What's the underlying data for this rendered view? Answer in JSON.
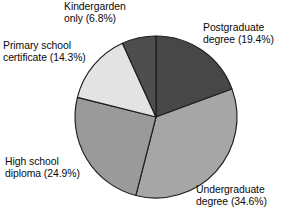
{
  "chart_data": {
    "type": "pie",
    "title": "",
    "subtitle": "",
    "xlabel": "",
    "ylabel": "",
    "legend_position": "none",
    "grid": false,
    "start_angle_deg": 0,
    "direction": "clockwise",
    "categories": [
      "Postgraduate degree",
      "Undergraduate degree",
      "High school diploma",
      "Primary school certificate",
      "Kindergarden only"
    ],
    "values": [
      19.4,
      34.6,
      24.9,
      14.3,
      6.8
    ],
    "units": "percent",
    "total": 100.0,
    "slices": [
      {
        "label": "Postgraduate degree",
        "value": 19.4,
        "value_text": "19.4%",
        "annotation": "Postgraduate\ndegree (19.4%)",
        "color": "#474747"
      },
      {
        "label": "Undergraduate degree",
        "value": 34.6,
        "value_text": "34.6%",
        "annotation": "Undergraduate\ndegree (34.6%)",
        "color": "#a6a6a6"
      },
      {
        "label": "High school diploma",
        "value": 24.9,
        "value_text": "24.9%",
        "annotation": "High school\ndiploma (24.9%)",
        "color": "#9a9a9a"
      },
      {
        "label": "Primary school certificate",
        "value": 14.3,
        "value_text": "14.3%",
        "annotation": "Primary school\ncertificate (14.3%)",
        "color": "#e3e3e3"
      },
      {
        "label": "Kindergarden only",
        "value": 6.8,
        "value_text": "6.8%",
        "annotation": "Kindergarden\nonly (6.8%)",
        "color": "#4e4e4e"
      }
    ]
  },
  "labels": {
    "kindergarden": "Kindergarden\nonly (6.8%)",
    "postgraduate": "Postgraduate\ndegree (19.4%)",
    "primary_school": "Primary school\ncertificate (14.3%)",
    "high_school": "High school\ndiploma (24.9%)",
    "undergraduate": "Undergraduate\ndegree (34.6%)"
  },
  "colors": {
    "background": "#ffffff",
    "outline": "#1d1d1d",
    "text": "#0a0a0a"
  },
  "geometry": {
    "center_x": 156,
    "center_y": 117,
    "radius": 81
  }
}
